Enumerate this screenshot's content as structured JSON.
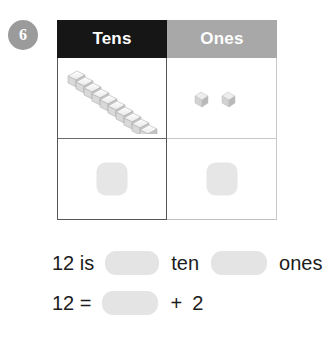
{
  "question": {
    "number": "6"
  },
  "table": {
    "headers": [
      {
        "label": "Tens",
        "bg": "#161616"
      },
      {
        "label": "Ones",
        "bg": "#a8a8a8"
      }
    ],
    "manipulatives": {
      "tens_rod": {
        "icon": "ten-rod-icon",
        "cube_count": 10
      },
      "ones_cubes": {
        "icon": "unit-cube-icon",
        "cube_count": 2
      }
    },
    "answer_boxes": [
      {
        "name": "tens-answer-box",
        "value": ""
      },
      {
        "name": "ones-answer-box",
        "value": ""
      }
    ]
  },
  "sentences": {
    "line1": {
      "prefix": "12 is",
      "middle": "ten",
      "suffix": "ones",
      "blank_ten": "",
      "blank_ones": ""
    },
    "line2": {
      "prefix": "12 =",
      "operator": "+",
      "addend": "2",
      "blank_sum": ""
    }
  },
  "colors": {
    "header_tens_bg": "#161616",
    "header_ones_bg": "#a8a8a8",
    "badge_bg": "#9b9b9b",
    "blank_fill": "#e4e4e4",
    "answer_box_fill": "#e6e6e6",
    "text": "#1c1c1c"
  }
}
